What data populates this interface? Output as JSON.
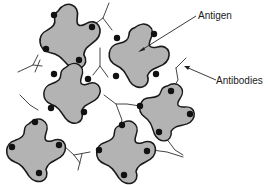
{
  "diagram": {
    "type": "antigen-antibody lattice",
    "labels": {
      "antigen": "Antigen",
      "antibodies": "Antibodies"
    },
    "colors": {
      "antigen_fill": "#b3b3b3",
      "antigen_outline": "#1a1a1a",
      "epitope": "#111111",
      "antibody_line": "#444444",
      "background": "#ffffff"
    },
    "antigen_count": 6,
    "epitopes_per_antigen": 4
  }
}
